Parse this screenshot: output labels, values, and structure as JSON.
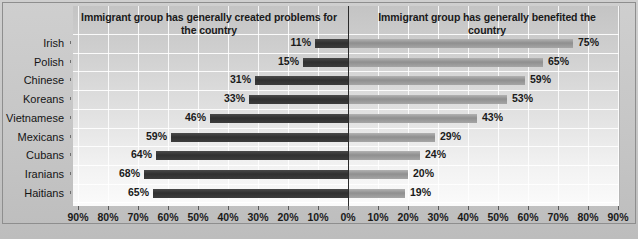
{
  "chart_data": {
    "type": "bar",
    "orientation": "horizontal",
    "style": "diverging-bar",
    "title": "",
    "headers": {
      "left": "Immigrant group has generally created problems for the country",
      "right": "Immigrant group has generally benefited the country"
    },
    "categories": [
      "Irish",
      "Polish",
      "Chinese",
      "Koreans",
      "Vietnamese",
      "Mexicans",
      "Cubans",
      "Iranians",
      "Haitians"
    ],
    "series": [
      {
        "name": "Immigrant group has generally created problems for the country",
        "side": "left",
        "color": "#3a3a3a",
        "values": [
          11,
          15,
          31,
          33,
          46,
          59,
          64,
          68,
          65
        ],
        "labels": [
          "11%",
          "15%",
          "31%",
          "33%",
          "46%",
          "59%",
          "64%",
          "68%",
          "65%"
        ]
      },
      {
        "name": "Immigrant group has generally benefited the country",
        "side": "right",
        "color": "#9a9a9a",
        "values": [
          75,
          65,
          59,
          53,
          43,
          29,
          24,
          20,
          19
        ],
        "labels": [
          "75%",
          "65%",
          "59%",
          "53%",
          "43%",
          "29%",
          "24%",
          "20%",
          "19%"
        ]
      }
    ],
    "xlabel": "",
    "ylabel": "",
    "xlim": [
      -90,
      90
    ],
    "x_ticks": [
      -90,
      -80,
      -70,
      -60,
      -50,
      -40,
      -30,
      -20,
      -10,
      0,
      10,
      20,
      30,
      40,
      50,
      60,
      70,
      80,
      90
    ],
    "x_tick_labels": [
      "90%",
      "80%",
      "70%",
      "60%",
      "50%",
      "40%",
      "30%",
      "20%",
      "10%",
      "0%",
      "10%",
      "20%",
      "30%",
      "40%",
      "50%",
      "60%",
      "70%",
      "80%",
      "90%"
    ],
    "grid": true,
    "legend_position": "none",
    "zero_line": true,
    "background_color": "#c9c9c9",
    "plot_background_color": "#e4e4e4",
    "gridline_color": "#ffffff"
  }
}
